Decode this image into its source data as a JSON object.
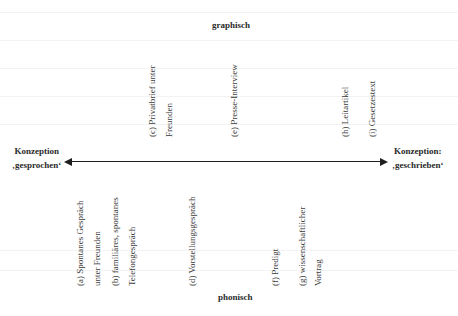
{
  "diagram": {
    "top_pole": "graphisch",
    "bottom_pole": "phonisch",
    "left_pole": {
      "line1": "Konzeption",
      "line2": "‚gesprochen‘"
    },
    "right_pole": {
      "line1": "Konzeption:",
      "line2": "‚geschrieben‘"
    },
    "axis": {
      "type": "double-headed-arrow",
      "color": "#1e1e1e"
    },
    "upper_items": [
      {
        "id": "c",
        "line1": "(c) Privatbrief unter",
        "line2": "Freunden"
      },
      {
        "id": "e",
        "line1": "(e) Presse-Interview"
      },
      {
        "id": "h",
        "line1": "(h) Leitartikel"
      },
      {
        "id": "i",
        "line1": "(i) Gesetzestext"
      }
    ],
    "lower_items": [
      {
        "id": "a",
        "line1": "(a) Spontanes Gespräch",
        "line2": "unter Freunden"
      },
      {
        "id": "b",
        "line1": "(b) familiäres, spontanes",
        "line2": "Telefongespräch"
      },
      {
        "id": "d",
        "line1": "(d) Vorstellungsgespräch"
      },
      {
        "id": "f",
        "line1": "(f) Predigt"
      },
      {
        "id": "g",
        "line1": "(g) wissenschaftlicher",
        "line2": "Vortrag"
      }
    ]
  }
}
